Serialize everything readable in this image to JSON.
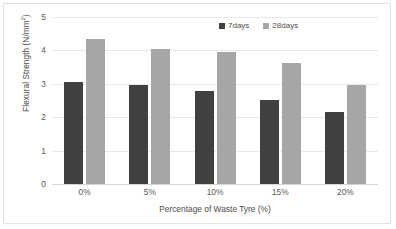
{
  "chart_data": {
    "type": "bar",
    "title": "",
    "xlabel": "Percentage of Waste Tyre (%)",
    "ylabel": "Flexural Strength (N/mm²)",
    "ylabel_main": "Flexural Strength (N/mm",
    "ylabel_sup": "2",
    "ylabel_tail": ")",
    "categories": [
      "0%",
      "5%",
      "10%",
      "15%",
      "20%"
    ],
    "series": [
      {
        "name": "7days",
        "color": "#404040",
        "values": [
          3.05,
          2.95,
          2.78,
          2.53,
          2.15
        ]
      },
      {
        "name": "28days",
        "color": "#a6a6a6",
        "values": [
          4.35,
          4.03,
          3.95,
          3.62,
          2.97
        ]
      }
    ],
    "ylim": [
      0,
      5
    ],
    "yticks": [
      "0",
      "1",
      "2",
      "3",
      "4",
      "5"
    ],
    "ytick_values": [
      0,
      1,
      2,
      3,
      4,
      5
    ],
    "grid": true,
    "legend_position": "top-right"
  },
  "legend": {
    "items": [
      {
        "label": "7days",
        "color": "#404040",
        "marker": "square-marker"
      },
      {
        "label": "28days",
        "color": "#a6a6a6",
        "marker": "square-marker"
      }
    ]
  }
}
